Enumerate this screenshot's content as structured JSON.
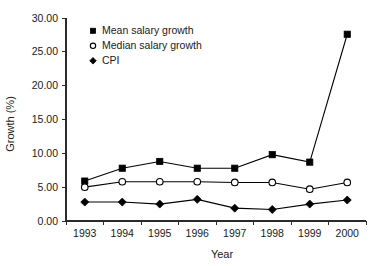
{
  "chart_data": {
    "type": "line",
    "title": "",
    "xlabel": "Year",
    "ylabel": "Growth (%)",
    "categories": [
      "1993",
      "1994",
      "1995",
      "1996",
      "1997",
      "1998",
      "1999",
      "2000"
    ],
    "ylim": [
      0,
      30
    ],
    "yticks": [
      0,
      5,
      10,
      15,
      20,
      25,
      30
    ],
    "ytick_labels": [
      "0.00",
      "5.00",
      "10.00",
      "15.00",
      "20.00",
      "25.00",
      "30.00"
    ],
    "grid": false,
    "legend_position": "top-left",
    "series": [
      {
        "name": "Mean salary growth",
        "marker": "filled-square",
        "values": [
          5.9,
          7.8,
          8.8,
          7.8,
          7.8,
          9.8,
          8.7,
          27.6
        ]
      },
      {
        "name": "Median salary growth",
        "marker": "open-circle",
        "values": [
          5.0,
          5.8,
          5.8,
          5.8,
          5.7,
          5.7,
          4.7,
          5.7
        ]
      },
      {
        "name": "CPI",
        "marker": "filled-diamond",
        "values": [
          2.8,
          2.8,
          2.5,
          3.2,
          1.9,
          1.7,
          2.5,
          3.1
        ]
      }
    ]
  },
  "axes": {
    "y_title": "Growth (%)",
    "x_title": "Year"
  },
  "legend": {
    "items": [
      {
        "label": "Mean salary growth",
        "marker": "filled-square"
      },
      {
        "label": "Median salary growth",
        "marker": "open-circle"
      },
      {
        "label": "CPI",
        "marker": "filled-diamond"
      }
    ]
  },
  "colors": {
    "line": "#000000",
    "axis": "#2b2b2b",
    "background": "#ffffff",
    "text": "#1a1a1a"
  }
}
